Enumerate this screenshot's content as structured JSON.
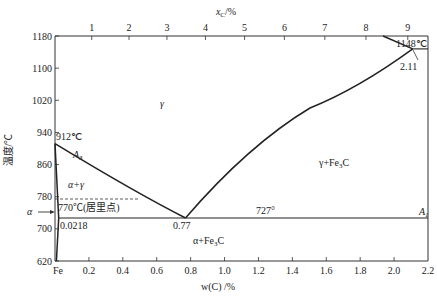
{
  "chart_data": {
    "type": "line",
    "xlabel": "w(C) /%",
    "x2label": "x_C/%",
    "ylabel": "温度/℃",
    "xlim": [
      0,
      2.2
    ],
    "ylim": [
      620,
      1180
    ],
    "grid": false,
    "x_ticks": [
      "Fe",
      "0.2",
      "0.4",
      "0.6",
      "0.8",
      "1.0",
      "1.2",
      "1.4",
      "1.6",
      "1.8",
      "2.0",
      "2.2"
    ],
    "x_tick_values": [
      0,
      0.2,
      0.4,
      0.6,
      0.8,
      1.0,
      1.2,
      1.4,
      1.6,
      1.8,
      2.0,
      2.2
    ],
    "x2_ticks": [
      "1",
      "2",
      "3",
      "4",
      "5",
      "6",
      "7",
      "8",
      "9"
    ],
    "y_ticks": [
      "620",
      "700",
      "780",
      "860",
      "940",
      "1020",
      "1100",
      "1180"
    ],
    "y_tick_values": [
      620,
      700,
      780,
      860,
      940,
      1020,
      1100,
      1180
    ],
    "series": [
      {
        "name": "A3 (GS line)",
        "points": [
          [
            0,
            912
          ],
          [
            0.1,
            870
          ],
          [
            0.3,
            815
          ],
          [
            0.5,
            770
          ],
          [
            0.77,
            727
          ]
        ]
      },
      {
        "name": "Acm (ES line)",
        "points": [
          [
            0.77,
            727
          ],
          [
            1.0,
            830
          ],
          [
            1.3,
            935
          ],
          [
            1.6,
            1020
          ],
          [
            1.85,
            1070
          ],
          [
            2.11,
            1148
          ]
        ]
      },
      {
        "name": "GP line (alpha solvus)",
        "points": [
          [
            0,
            912
          ],
          [
            0.0218,
            727
          ]
        ]
      },
      {
        "name": "PQ line",
        "points": [
          [
            0.0218,
            727
          ],
          [
            0.008,
            620
          ]
        ]
      },
      {
        "name": "A1 eutectoid line",
        "points": [
          [
            0.0218,
            727
          ],
          [
            2.2,
            727
          ]
        ]
      },
      {
        "name": "Eutectic line",
        "points": [
          [
            2.11,
            1148
          ],
          [
            2.2,
            1148
          ]
        ]
      },
      {
        "name": "ECF line",
        "points": [
          [
            2.11,
            1148
          ],
          [
            1.93,
            1180
          ]
        ]
      },
      {
        "name": "Curie point (dashed)",
        "points": [
          [
            0,
            770
          ],
          [
            0.5,
            770
          ]
        ]
      }
    ],
    "annotations": [
      {
        "text": "912℃",
        "x": 0.0,
        "y": 912
      },
      {
        "text": "A3",
        "x": 0.2,
        "y": 880
      },
      {
        "text": "γ",
        "x": 0.6,
        "y": 1010
      },
      {
        "text": "α+γ",
        "x": 0.15,
        "y": 805
      },
      {
        "text": "770℃(居里点)",
        "x": 0.02,
        "y": 752
      },
      {
        "text": "α",
        "x": -0.1,
        "y": 737
      },
      {
        "text": "0.0218",
        "x": 0.02,
        "y": 712
      },
      {
        "text": "0.77",
        "x": 0.77,
        "y": 712
      },
      {
        "text": "727°",
        "x": 1.2,
        "y": 731
      },
      {
        "text": "A1",
        "x": 2.1,
        "y": 731
      },
      {
        "text": "α+Fe3C",
        "x": 0.9,
        "y": 680
      },
      {
        "text": "γ+Fe3C",
        "x": 1.8,
        "y": 890
      },
      {
        "text": "1148℃",
        "x": 2.15,
        "y": 1158
      },
      {
        "text": "2.11",
        "x": 2.11,
        "y": 1128
      }
    ]
  },
  "labels": {
    "xlabel": "w(C) /%",
    "x2label_main": "x",
    "x2label_sub": "C",
    "x2label_unit": "/%",
    "ylabel": "温度/℃",
    "t912": "912℃",
    "a3_main": "A",
    "a3_sub": "3",
    "gamma": "γ",
    "alpha_gamma": "α+γ",
    "curie": "770℃(居里点)",
    "alpha": "α",
    "c0218": "0.0218",
    "c077": "0.77",
    "t727": "727°",
    "a1_main": "A",
    "a1_sub": "1",
    "alpha_fe3c_main": "α+Fe",
    "alpha_fe3c_sub": "3",
    "alpha_fe3c_end": "C",
    "gamma_fe3c_main": "γ+Fe",
    "gamma_fe3c_sub": "3",
    "gamma_fe3c_end": "C",
    "t1148": "1148℃",
    "c211": "2.11"
  }
}
